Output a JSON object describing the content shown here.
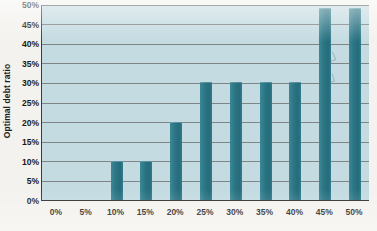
{
  "chart_data": {
    "type": "bar",
    "title": "",
    "subtitle": "",
    "xlabel": "",
    "ylabel": "Optimal debt ratio",
    "categories": [
      "0%",
      "5%",
      "10%",
      "15%",
      "20%",
      "25%",
      "30%",
      "35%",
      "40%",
      "45%",
      "50%"
    ],
    "values": [
      0,
      0,
      10,
      10,
      20,
      30,
      30,
      30,
      30,
      49,
      49
    ],
    "ylim": [
      0,
      50
    ],
    "ytick_labels": [
      "0%",
      "5%",
      "10%",
      "15%",
      "20%",
      "25%",
      "30%",
      "35%",
      "40%",
      "45%",
      "50%"
    ],
    "ytick_values": [
      0,
      5,
      10,
      15,
      20,
      25,
      30,
      35,
      40,
      45,
      50
    ],
    "grid": true,
    "grid_axis": "y",
    "legend": false,
    "legend_position": "none",
    "annotations": []
  },
  "colors": {
    "bar": "#2b7483",
    "bar_light": "#3b8896",
    "plot_background": "#c3dbe1",
    "page_background": "#f3f2ee",
    "gridline": "#6c6c6c",
    "axis": "#2e2e2e",
    "text": "#191919"
  }
}
